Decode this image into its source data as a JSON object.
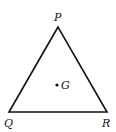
{
  "diagram": {
    "type": "triangle",
    "vertices": [
      {
        "label": "P",
        "x": 58,
        "y": 27
      },
      {
        "label": "Q",
        "x": 9,
        "y": 112
      },
      {
        "label": "R",
        "x": 107,
        "y": 112
      }
    ],
    "points": [
      {
        "label": "G",
        "x": 57,
        "y": 85
      }
    ],
    "stroke_color": "#111111",
    "background": "#ffffff"
  }
}
